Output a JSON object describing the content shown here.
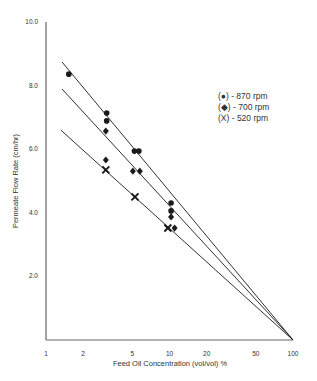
{
  "chart_data": {
    "type": "scatter",
    "title": "",
    "xlabel": "Feed Oil Concentration (vol/vol) %",
    "ylabel": "Permeate Flow Rate (cm/hr)",
    "xscale": "log",
    "xlim": [
      1,
      100
    ],
    "ylim": [
      0,
      10
    ],
    "x_ticks": [
      1,
      2,
      5,
      10,
      20,
      50,
      100
    ],
    "x_tick_labels": [
      "1",
      "2",
      "5",
      "10",
      "20",
      "50",
      "100"
    ],
    "y_ticks": [
      2,
      4,
      6,
      8,
      10
    ],
    "y_tick_labels": [
      "2.0",
      "4.0",
      "6.0",
      "8.0",
      "10.0"
    ],
    "grid": false,
    "legend_position": "upper right",
    "series": [
      {
        "name": "870 rpm",
        "legend_label": "(●) - 870 rpm",
        "marker": "circle",
        "points": [
          [
            1.53,
            8.36
          ],
          [
            3.1,
            7.14
          ],
          [
            3.1,
            6.89
          ],
          [
            5.2,
            5.94
          ],
          [
            5.65,
            5.94
          ],
          [
            10.3,
            4.31
          ],
          [
            10.3,
            4.06
          ]
        ],
        "fit_line": [
          [
            1.35,
            8.74
          ],
          [
            100,
            0
          ]
        ]
      },
      {
        "name": "700 rpm",
        "legend_label": "(◆) - 700 rpm",
        "marker": "diamond",
        "points": [
          [
            3.05,
            6.57
          ],
          [
            3.05,
            5.66
          ],
          [
            5.05,
            5.31
          ],
          [
            5.75,
            5.31
          ],
          [
            10.3,
            3.87
          ],
          [
            11.0,
            3.52
          ]
        ],
        "fit_line": [
          [
            1.35,
            7.89
          ],
          [
            100,
            0
          ]
        ]
      },
      {
        "name": "520 rpm",
        "legend_label": "(X) - 520 rpm",
        "marker": "x",
        "points": [
          [
            3.05,
            5.35
          ],
          [
            5.25,
            4.5
          ],
          [
            9.7,
            3.52
          ]
        ],
        "fit_line": [
          [
            1.32,
            6.6
          ],
          [
            100,
            0
          ]
        ]
      }
    ]
  },
  "colors": {
    "ink": "#1a1a1a",
    "axis": "#555555",
    "background": "#ffffff"
  }
}
